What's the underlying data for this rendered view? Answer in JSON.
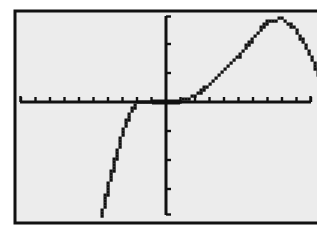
{
  "chart_data": {
    "type": "line",
    "title": "",
    "xlabel": "",
    "ylabel": "",
    "grid": false,
    "legend": null,
    "x_axis": {
      "tick_count_left": 10,
      "tick_count_right": 10,
      "tick_labels": []
    },
    "y_axis": {
      "tick_count_up": 3,
      "tick_count_down": 4,
      "tick_labels": []
    },
    "xlim_ticks": [
      -10,
      10
    ],
    "ylim_ticks": [
      -4,
      3.5
    ],
    "series": [
      {
        "name": "f(x)",
        "points_in_tick_units": [
          [
            -4.4,
            -3.9
          ],
          [
            -4.0,
            -3.0
          ],
          [
            -3.5,
            -2.0
          ],
          [
            -3.0,
            -1.1
          ],
          [
            -2.5,
            -0.4
          ],
          [
            -2.0,
            0.0
          ],
          [
            -1.0,
            0.05
          ],
          [
            0.0,
            0.0
          ],
          [
            1.0,
            0.05
          ],
          [
            2.0,
            0.2
          ],
          [
            3.0,
            0.6
          ],
          [
            4.0,
            1.1
          ],
          [
            5.0,
            1.6
          ],
          [
            6.0,
            2.2
          ],
          [
            7.0,
            2.75
          ],
          [
            8.0,
            2.9
          ],
          [
            9.0,
            2.5
          ],
          [
            10.0,
            1.6
          ],
          [
            11.0,
            0.4
          ],
          [
            11.6,
            -0.6
          ],
          [
            12.0,
            -1.6
          ],
          [
            12.5,
            -3.0
          ],
          [
            12.9,
            -3.9
          ]
        ]
      }
    ],
    "colors": {
      "screen_bg": "#ececec",
      "ink": "#111111"
    }
  }
}
